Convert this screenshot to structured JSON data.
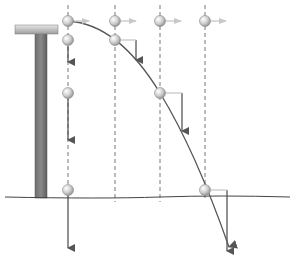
{
  "diagram": {
    "colors": {
      "background": "#ffffff",
      "arrow": "#555555",
      "velocity_horizontal": "#c8c8c8",
      "dashed_line": "#777777",
      "ground": "#444444",
      "post": "#7a7a7a",
      "platform": "#b0b0b0",
      "ball": "#cfcfcf",
      "trajectory": "#555555"
    },
    "ground_y": 197,
    "dashed_lines_x": [
      68,
      115,
      160,
      205
    ],
    "balls": [
      {
        "x": 68,
        "y": 21,
        "h_arrow": true,
        "v_arrow": 0
      },
      {
        "x": 115,
        "y": 21,
        "h_arrow": true,
        "v_arrow": 0
      },
      {
        "x": 160,
        "y": 21,
        "h_arrow": true,
        "v_arrow": 0
      },
      {
        "x": 205,
        "y": 21,
        "h_arrow": true,
        "v_arrow": 0
      },
      {
        "x": 68,
        "y": 40,
        "h_arrow": false,
        "v_arrow": 20
      },
      {
        "x": 115,
        "y": 40,
        "h_arrow": true,
        "v_arrow": 20
      },
      {
        "x": 68,
        "y": 93,
        "h_arrow": false,
        "v_arrow": 40
      },
      {
        "x": 160,
        "y": 93,
        "h_arrow": true,
        "v_arrow": 40
      },
      {
        "x": 68,
        "y": 190,
        "h_arrow": false,
        "v_arrow": 60
      },
      {
        "x": 205,
        "y": 190,
        "h_arrow": true,
        "v_arrow": 60
      }
    ]
  }
}
